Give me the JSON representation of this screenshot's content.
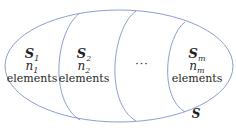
{
  "diagram": {
    "type": "set-partition",
    "stroke_color": "#8a9fd0",
    "outer_set": {
      "label": "S"
    },
    "partitions": [
      {
        "set_base": "S",
        "set_sub": "1",
        "count_base": "n",
        "count_sub": "1",
        "elements_label": "elements"
      },
      {
        "set_base": "S",
        "set_sub": "2",
        "count_base": "n",
        "count_sub": "2",
        "elements_label": "elements"
      },
      {
        "ellipsis": "···"
      },
      {
        "set_base": "S",
        "set_sub": "m",
        "count_base": "n",
        "count_sub": "m",
        "elements_label": "elements"
      }
    ]
  }
}
